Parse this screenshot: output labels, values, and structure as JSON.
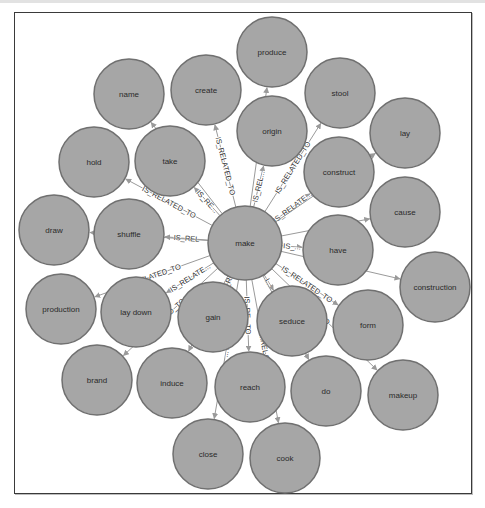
{
  "graph": {
    "center_node": "make",
    "relationship_type": "IS_RELATED_TO",
    "colors": {
      "node_fill": "#a6a6a6",
      "node_stroke": "#707070",
      "edge": "#9a9a9a",
      "frame": "#3a3a3a"
    },
    "nodes": [
      {
        "id": "make",
        "label": "make",
        "x": 245,
        "y": 243,
        "r": 37
      },
      {
        "id": "produce",
        "label": "produce",
        "x": 272,
        "y": 52,
        "r": 35
      },
      {
        "id": "name",
        "label": "name",
        "x": 129,
        "y": 94,
        "r": 35
      },
      {
        "id": "create",
        "label": "create",
        "x": 206,
        "y": 90,
        "r": 35
      },
      {
        "id": "stool",
        "label": "stool",
        "x": 340,
        "y": 93,
        "r": 35
      },
      {
        "id": "origin",
        "label": "origin",
        "x": 272,
        "y": 131,
        "r": 35
      },
      {
        "id": "lay",
        "label": "lay",
        "x": 405,
        "y": 133,
        "r": 35
      },
      {
        "id": "hold",
        "label": "hold",
        "x": 94,
        "y": 162,
        "r": 35
      },
      {
        "id": "take",
        "label": "take",
        "x": 170,
        "y": 161,
        "r": 35
      },
      {
        "id": "construct",
        "label": "construct",
        "x": 339,
        "y": 172,
        "r": 35
      },
      {
        "id": "cause",
        "label": "cause",
        "x": 405,
        "y": 212,
        "r": 35
      },
      {
        "id": "draw",
        "label": "draw",
        "x": 54,
        "y": 230,
        "r": 35
      },
      {
        "id": "shuffle",
        "label": "shuffle",
        "x": 129,
        "y": 234,
        "r": 35
      },
      {
        "id": "have",
        "label": "have",
        "x": 338,
        "y": 250,
        "r": 35
      },
      {
        "id": "construction",
        "label": "construction",
        "x": 435,
        "y": 287,
        "r": 35
      },
      {
        "id": "production",
        "label": "production",
        "x": 61,
        "y": 309,
        "r": 35
      },
      {
        "id": "lay_down",
        "label": "lay down",
        "x": 136,
        "y": 312,
        "r": 35
      },
      {
        "id": "gain",
        "label": "gain",
        "x": 213,
        "y": 317,
        "r": 35
      },
      {
        "id": "seduce",
        "label": "seduce",
        "x": 292,
        "y": 321,
        "r": 35
      },
      {
        "id": "form",
        "label": "form",
        "x": 368,
        "y": 325,
        "r": 35
      },
      {
        "id": "brand",
        "label": "brand",
        "x": 97,
        "y": 380,
        "r": 35
      },
      {
        "id": "induce",
        "label": "induce",
        "x": 172,
        "y": 383,
        "r": 35
      },
      {
        "id": "reach",
        "label": "reach",
        "x": 250,
        "y": 387,
        "r": 35
      },
      {
        "id": "do",
        "label": "do",
        "x": 326,
        "y": 391,
        "r": 35
      },
      {
        "id": "makeup",
        "label": "makeup",
        "x": 403,
        "y": 395,
        "r": 35
      },
      {
        "id": "close",
        "label": "close",
        "x": 208,
        "y": 454,
        "r": 35
      },
      {
        "id": "cook",
        "label": "cook",
        "x": 285,
        "y": 458,
        "r": 35
      }
    ],
    "edges": [
      {
        "from": "make",
        "to": "create",
        "label": "IS_RELATED_TO"
      },
      {
        "from": "make",
        "to": "origin",
        "label": "IS_REL..."
      },
      {
        "from": "make",
        "to": "produce",
        "label": "IS_R..."
      },
      {
        "from": "make",
        "to": "stool",
        "label": "IS_RELATED_TO"
      },
      {
        "from": "make",
        "to": "construct",
        "label": "IS_RELATE..."
      },
      {
        "from": "make",
        "to": "lay",
        "label": "IS_RE..."
      },
      {
        "from": "make",
        "to": "take",
        "label": "IS_RE..."
      },
      {
        "from": "make",
        "to": "name",
        "label": "...TO"
      },
      {
        "from": "make",
        "to": "hold",
        "label": "IS_RELATED_TO"
      },
      {
        "from": "make",
        "to": "shuffle",
        "label": "IS_REL"
      },
      {
        "from": "make",
        "to": "draw",
        "label": "...TO"
      },
      {
        "from": "make",
        "to": "have",
        "label": "IS_..."
      },
      {
        "from": "make",
        "to": "cause",
        "label": "IS_R..."
      },
      {
        "from": "make",
        "to": "construction",
        "label": "IS..."
      },
      {
        "from": "make",
        "to": "form",
        "label": "IS_RELATED_TO"
      },
      {
        "from": "make",
        "to": "makeup",
        "label": "...O"
      },
      {
        "from": "make",
        "to": "seduce",
        "label": "I..."
      },
      {
        "from": "make",
        "to": "do",
        "label": ""
      },
      {
        "from": "make",
        "to": "lay_down",
        "label": "IS_RELATE..."
      },
      {
        "from": "make",
        "to": "production",
        "label": "IS_RELATED_TO"
      },
      {
        "from": "make",
        "to": "brand",
        "label": "...TED_TO"
      },
      {
        "from": "make",
        "to": "gain",
        "label": "IS_RE..."
      },
      {
        "from": "make",
        "to": "induce",
        "label": ""
      },
      {
        "from": "make",
        "to": "reach",
        "label": "IS_RE...TO"
      },
      {
        "from": "make",
        "to": "close",
        "label": "...TO"
      },
      {
        "from": "make",
        "to": "cook",
        "label": "...RELAT..."
      }
    ]
  }
}
